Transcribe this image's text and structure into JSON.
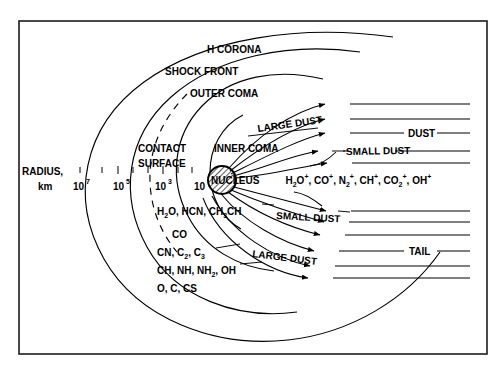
{
  "figure": {
    "frame_color": "#1c1c1c",
    "background": "#ffffff",
    "ink_color": "#000000"
  },
  "axis": {
    "label_line1": "RADIUS,",
    "label_line2": "km",
    "ticks": [
      {
        "mantissa": "10",
        "exponent": "7"
      },
      {
        "mantissa": "10",
        "exponent": "5"
      },
      {
        "mantissa": "10",
        "exponent": "3"
      },
      {
        "mantissa": "10",
        "exponent": ""
      }
    ]
  },
  "shells": [
    {
      "name": "h-corona",
      "label": "H CORONA",
      "style": "solid"
    },
    {
      "name": "shock-front",
      "label": "SHOCK FRONT",
      "style": "solid"
    },
    {
      "name": "outer-coma",
      "label": "OUTER COMA",
      "style": "solid"
    },
    {
      "name": "contact-surface",
      "label_line1": "CONTACT",
      "label_line2": "SURFACE",
      "style": "dashed"
    },
    {
      "name": "inner-coma",
      "label": "INNER COMA",
      "style": "solid"
    }
  ],
  "nucleus": {
    "label": "NUCLEUS",
    "fill": "hatched"
  },
  "ions": {
    "label": "ion species",
    "items": [
      {
        "formula": "H",
        "sub": "2",
        "tail": "O",
        "charge": "+"
      },
      {
        "formula": "CO",
        "sub": "",
        "tail": "",
        "charge": "+"
      },
      {
        "formula": "N",
        "sub": "2",
        "tail": "",
        "charge": "+"
      },
      {
        "formula": "CH",
        "sub": "",
        "tail": "",
        "charge": "+"
      },
      {
        "formula": "CO",
        "sub": "2",
        "tail": "",
        "charge": "+"
      },
      {
        "formula": "OH",
        "sub": "",
        "tail": "",
        "charge": "+"
      }
    ],
    "plain_text": "H2O+, CO+, N2+, CH+, CO2+, OH+"
  },
  "neutrals": {
    "rows": [
      {
        "id": "row-1",
        "plain_text": "H2O, HCN, CH3CH"
      },
      {
        "id": "row-2",
        "plain_text": "CO"
      },
      {
        "id": "row-3",
        "plain_text": "CN, C2, C3"
      },
      {
        "id": "row-4",
        "plain_text": "CH, NH, NH2, OH"
      },
      {
        "id": "row-5",
        "plain_text": "O, C, CS"
      }
    ]
  },
  "flow_labels": {
    "large_dust_upper": "LARGE DUST",
    "small_dust_upper": "SMALL DUST",
    "small_dust_lower": "SMALL DUST",
    "large_dust_lower": "LARGE DUST"
  },
  "tail_labels": {
    "dust": "DUST",
    "tail": "TAIL"
  }
}
